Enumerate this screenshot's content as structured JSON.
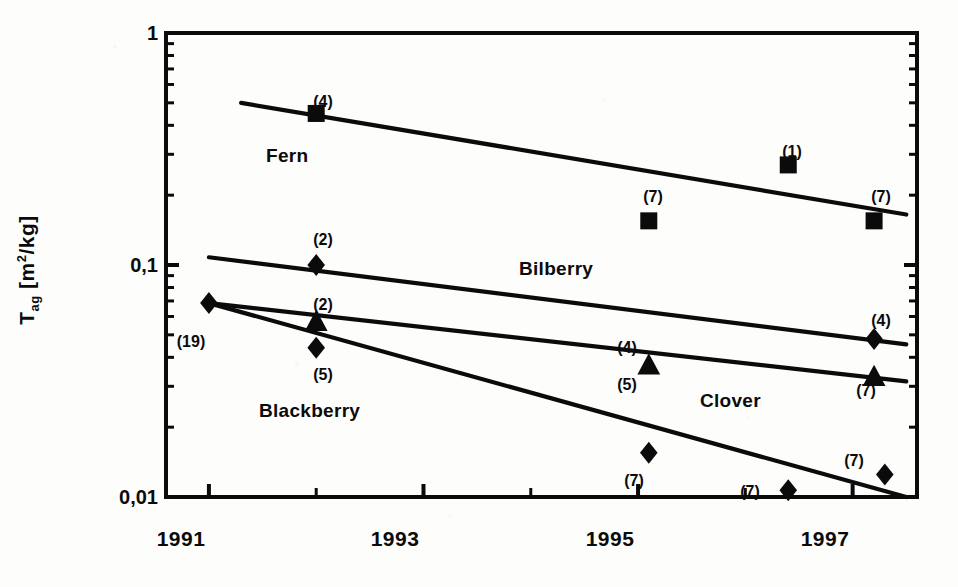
{
  "axes": {
    "y_label_main": "T",
    "y_label_sub": "ag",
    "y_label_unit_open": " [m",
    "y_label_unit_sup": "2",
    "y_label_unit_close": "/kg]",
    "y_tick_labels": [
      "1",
      "0,1",
      "0,01"
    ],
    "x_tick_labels": [
      "1991",
      "1993",
      "1995",
      "1997"
    ]
  },
  "series_labels": {
    "fern": "Fern",
    "bilberry": "Bilberry",
    "blackberry": "Blackberry",
    "clover": "Clover"
  },
  "counts": {
    "fern_1992": "(4)",
    "fern_1995": "(7)",
    "fern_1996": "(1)",
    "fern_1997": "(7)",
    "bilberry_1992": "(2)",
    "bilberry_1997": "(4)",
    "clover_1992": "(2)",
    "clover_1995": "(4)",
    "clover_1997": "(7)",
    "blackberry_1991": "(19)",
    "blackberry_1992": "(5)",
    "blackberry_1995_upper": "(5)",
    "blackberry_1995": "(7)",
    "blackberry_1996": "(7)",
    "blackberry_1997": "(7)"
  },
  "colors": {
    "ink": "#0b0b0b",
    "paper": "#fdfdfb"
  },
  "chart_data": {
    "type": "scatter",
    "title": "",
    "xlabel": "",
    "ylabel": "T_ag [m2/kg]",
    "yscale": "log",
    "xlim": [
      1990.6,
      1997.6
    ],
    "ylim": [
      0.01,
      1
    ],
    "xticks": [
      1991,
      1992,
      1993,
      1994,
      1995,
      1996,
      1997
    ],
    "xticklabels": [
      "1991",
      "",
      "1993",
      "",
      "1995",
      "",
      "1997"
    ],
    "yticks": [
      0.01,
      0.1,
      1
    ],
    "yticklabels": [
      "0,01",
      "0,1",
      "1"
    ],
    "grid": false,
    "legend": "inline-annotations",
    "series": [
      {
        "name": "Fern",
        "marker": "square",
        "points": [
          {
            "x": 1992.0,
            "y": 0.45,
            "n": 4
          },
          {
            "x": 1995.1,
            "y": 0.155,
            "n": 7
          },
          {
            "x": 1996.4,
            "y": 0.27,
            "n": 1
          },
          {
            "x": 1997.2,
            "y": 0.155,
            "n": 7
          }
        ],
        "trend_line": {
          "x0": 1991.3,
          "y0": 0.5,
          "x1": 1997.5,
          "y1": 0.165
        }
      },
      {
        "name": "Bilberry",
        "marker": "diamond",
        "points": [
          {
            "x": 1992.0,
            "y": 0.1,
            "n": 2
          },
          {
            "x": 1997.2,
            "y": 0.048,
            "n": 4
          }
        ],
        "trend_line": {
          "x0": 1991.0,
          "y0": 0.108,
          "x1": 1997.5,
          "y1": 0.0455
        }
      },
      {
        "name": "Clover",
        "marker": "triangle",
        "points": [
          {
            "x": 1992.0,
            "y": 0.057,
            "n": 2
          },
          {
            "x": 1995.1,
            "y": 0.037,
            "n": 4
          },
          {
            "x": 1997.2,
            "y": 0.033,
            "n": 7
          }
        ],
        "trend_line": {
          "x0": 1991.0,
          "y0": 0.0685,
          "x1": 1997.5,
          "y1": 0.0315
        }
      },
      {
        "name": "Blackberry",
        "marker": "diamond",
        "points": [
          {
            "x": 1991.0,
            "y": 0.0685,
            "n": 19
          },
          {
            "x": 1992.0,
            "y": 0.044,
            "n": 5
          },
          {
            "x": 1995.1,
            "y": 0.0155,
            "n": 7
          },
          {
            "x": 1996.4,
            "y": 0.0107,
            "n": 7
          },
          {
            "x": 1997.3,
            "y": 0.0125,
            "n": 7
          }
        ],
        "trend_line": {
          "x0": 1991.0,
          "y0": 0.0685,
          "x1": 1997.5,
          "y1": 0.01
        }
      }
    ]
  }
}
